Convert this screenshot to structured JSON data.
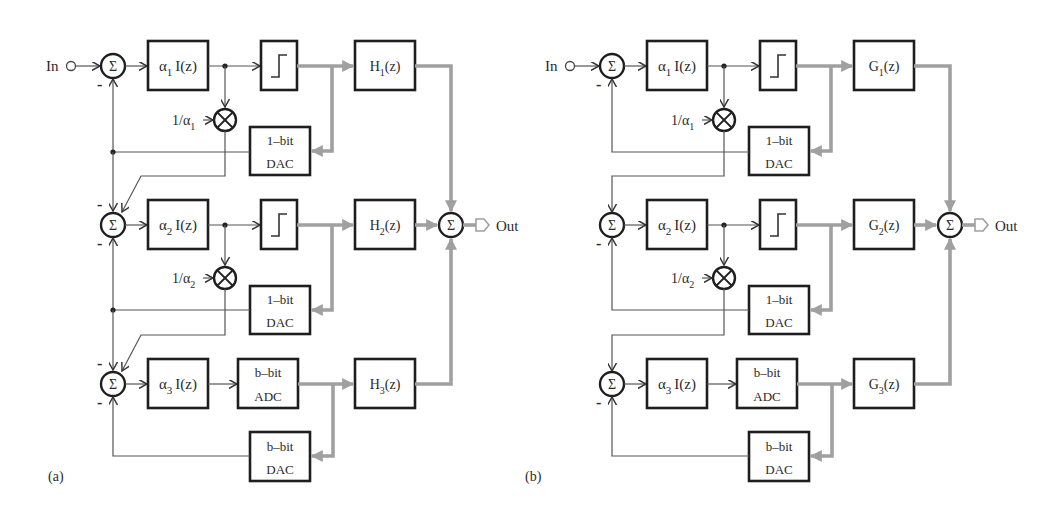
{
  "panels": [
    {
      "id": "a",
      "label": "(a)",
      "input_label": "In",
      "output_label": "Out",
      "stages": [
        {
          "integrator": {
            "coef": "α",
            "sub": "1",
            "fn": "I(z)"
          },
          "quantizer": "comparator",
          "filter": {
            "name": "H",
            "sub": "1",
            "arg": "(z)"
          },
          "scale": {
            "num": "1/α",
            "sub": "1"
          },
          "dac": {
            "line1": "1–bit",
            "line2": "DAC"
          }
        },
        {
          "integrator": {
            "coef": "α",
            "sub": "2",
            "fn": "I(z)"
          },
          "quantizer": "comparator",
          "filter": {
            "name": "H",
            "sub": "2",
            "arg": "(z)"
          },
          "scale": {
            "num": "1/α",
            "sub": "2"
          },
          "dac": {
            "line1": "1–bit",
            "line2": "DAC"
          }
        },
        {
          "integrator": {
            "coef": "α",
            "sub": "3",
            "fn": "I(z)"
          },
          "adc": {
            "line1": "b–bit",
            "line2": "ADC"
          },
          "filter": {
            "name": "H",
            "sub": "3",
            "arg": "(z)"
          },
          "dac": {
            "line1": "b–bit",
            "line2": "DAC"
          }
        }
      ],
      "sum_symbol": "Σ",
      "minus_sign": "-"
    },
    {
      "id": "b",
      "label": "(b)",
      "input_label": "In",
      "output_label": "Out",
      "stages": [
        {
          "integrator": {
            "coef": "α",
            "sub": "1",
            "fn": "I(z)"
          },
          "quantizer": "comparator",
          "filter": {
            "name": "G",
            "sub": "1",
            "arg": "(z)"
          },
          "scale": {
            "num": "1/α",
            "sub": "1"
          },
          "dac": {
            "line1": "1–bit",
            "line2": "DAC"
          }
        },
        {
          "integrator": {
            "coef": "α",
            "sub": "2",
            "fn": "I(z)"
          },
          "quantizer": "comparator",
          "filter": {
            "name": "G",
            "sub": "2",
            "arg": "(z)"
          },
          "scale": {
            "num": "1/α",
            "sub": "2"
          },
          "dac": {
            "line1": "1–bit",
            "line2": "DAC"
          }
        },
        {
          "integrator": {
            "coef": "α",
            "sub": "3",
            "fn": "I(z)"
          },
          "adc": {
            "line1": "b–bit",
            "line2": "ADC"
          },
          "filter": {
            "name": "G",
            "sub": "3",
            "arg": "(z)"
          },
          "dac": {
            "line1": "b–bit",
            "line2": "DAC"
          }
        }
      ],
      "sum_symbol": "Σ",
      "minus_sign": "-"
    }
  ],
  "colors": {
    "block_stroke": "#1e1e1e",
    "analog_wire": "#555555",
    "digital_bus": "#a0a0a0",
    "text": "#2a2a2a",
    "background": "#ffffff"
  }
}
